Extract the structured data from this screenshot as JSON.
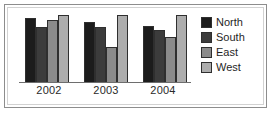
{
  "chart_data": {
    "type": "bar",
    "title": "",
    "subtitle": "",
    "xlabel": "",
    "ylabel": "",
    "categories": [
      "2002",
      "2003",
      "2004"
    ],
    "series": [
      {
        "name": "North",
        "color": "#1c1c1c",
        "values": [
          90,
          85,
          79
        ]
      },
      {
        "name": "South",
        "color": "#3c3c3c",
        "values": [
          78,
          77,
          73
        ]
      },
      {
        "name": "East",
        "color": "#8b8b8b",
        "values": [
          87,
          50,
          63
        ]
      },
      {
        "name": "West",
        "color": "#adadad",
        "values": [
          95,
          95,
          95
        ]
      }
    ],
    "ylim": [
      0,
      100
    ],
    "grid": false,
    "legend_position": "right",
    "axis_color": "#6e6e6e",
    "bar_border_color": "#2f2f2f",
    "frame_color": "#8d8d8d",
    "background": "#ffffff"
  },
  "legend": {
    "items": [
      {
        "label": "North",
        "color": "#1c1c1c"
      },
      {
        "label": "South",
        "color": "#3c3c3c"
      },
      {
        "label": "East",
        "color": "#8b8b8b"
      },
      {
        "label": "West",
        "color": "#adadad"
      }
    ]
  },
  "axis": {
    "ticks": [
      "2002",
      "2003",
      "2004"
    ]
  }
}
